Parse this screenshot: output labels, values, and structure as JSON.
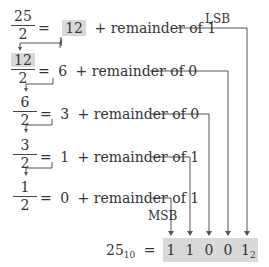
{
  "rows": [
    {
      "numerator": "25",
      "denominator": "2",
      "quotient": "12",
      "remainder_text": "+ remainder of 1",
      "quotient_highlighted": true
    },
    {
      "numerator": "12",
      "denominator": "2",
      "quotient": "6",
      "remainder_text": "+ remainder of 0",
      "numerator_highlighted": true
    },
    {
      "numerator": "6",
      "denominator": "2",
      "quotient": "3",
      "remainder_text": "+ remainder of 0"
    },
    {
      "numerator": "3",
      "denominator": "2",
      "quotient": "1",
      "remainder_text": "+ remainder of 1"
    },
    {
      "numerator": "1",
      "denominator": "2",
      "quotient": "0",
      "remainder_text": "+ remainder of 1"
    }
  ],
  "equals": "=",
  "labels": {
    "lsb": "LSB",
    "msb": "MSB"
  },
  "result": {
    "decimal": "25",
    "decimal_base": "10",
    "equals": "=",
    "bits": [
      "1",
      "1",
      "0",
      "0",
      "1"
    ],
    "binary_base": "2"
  },
  "colors": {
    "highlight": "#d9d9d9",
    "line": "#555555",
    "text": "#333333"
  }
}
